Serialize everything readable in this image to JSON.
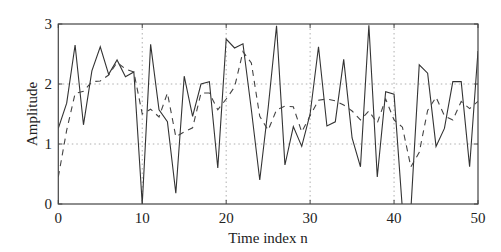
{
  "chart_data": {
    "type": "line",
    "title": "",
    "xlabel": "Time index n",
    "ylabel": "Amplitude",
    "xlim": [
      0,
      50
    ],
    "ylim": [
      0,
      3
    ],
    "grid": true,
    "legend": null,
    "x_ticks": [
      0,
      10,
      20,
      30,
      40,
      50
    ],
    "y_ticks": [
      0,
      1,
      2,
      3
    ],
    "x_tick_labels": [
      "0",
      "10",
      "20",
      "30",
      "40",
      "50"
    ],
    "y_tick_labels": [
      "0",
      "1",
      "2",
      "3"
    ],
    "x": [
      0,
      1,
      2,
      3,
      4,
      5,
      6,
      7,
      8,
      9,
      10,
      11,
      12,
      13,
      14,
      15,
      16,
      17,
      18,
      19,
      20,
      21,
      22,
      23,
      24,
      25,
      26,
      27,
      28,
      29,
      30,
      31,
      32,
      33,
      34,
      35,
      36,
      37,
      38,
      39,
      40,
      41,
      42,
      43,
      44,
      45,
      46,
      47,
      48,
      49,
      50
    ],
    "series": [
      {
        "name": "solid",
        "style": "solid",
        "values": [
          1.26,
          1.68,
          2.65,
          1.32,
          2.22,
          2.62,
          2.16,
          2.4,
          2.12,
          2.2,
          0.0,
          2.66,
          1.57,
          1.37,
          0.18,
          2.13,
          1.46,
          2.0,
          2.04,
          0.6,
          2.75,
          2.6,
          2.67,
          1.57,
          0.4,
          1.6,
          2.97,
          0.65,
          1.29,
          0.96,
          1.5,
          2.62,
          1.3,
          1.37,
          2.41,
          1.1,
          0.62,
          2.98,
          0.45,
          1.87,
          1.83,
          -0.1,
          -0.1,
          2.32,
          2.18,
          0.96,
          1.26,
          2.04,
          2.04,
          0.62,
          2.55
        ]
      },
      {
        "name": "dashed",
        "style": "dashed",
        "values": [
          0.45,
          1.23,
          1.84,
          1.88,
          2.04,
          2.05,
          2.15,
          2.36,
          2.25,
          2.2,
          1.5,
          1.58,
          1.45,
          1.85,
          1.12,
          1.2,
          1.27,
          1.85,
          1.85,
          1.57,
          1.75,
          1.95,
          2.54,
          2.35,
          1.46,
          1.23,
          1.57,
          1.63,
          1.62,
          1.2,
          1.47,
          1.73,
          1.75,
          1.72,
          1.65,
          1.55,
          1.4,
          1.55,
          1.35,
          1.75,
          1.4,
          1.28,
          0.62,
          0.86,
          1.56,
          1.78,
          1.47,
          1.4,
          1.71,
          1.59,
          1.71
        ]
      }
    ]
  },
  "colors": {
    "line": "#333333",
    "frame": "#444444",
    "grid": "#9a9a9a",
    "background": "#ffffff"
  }
}
